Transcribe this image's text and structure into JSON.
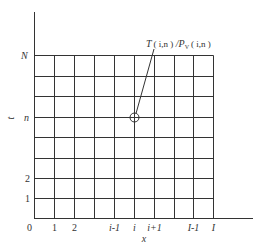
{
  "diagram": {
    "type": "finite-difference-grid",
    "annotation": {
      "T": "T",
      "args1": "( i,n )",
      "sep": " /",
      "P": "P",
      "sub": "V",
      "args2": "( i,n )"
    },
    "axes": {
      "x_label": "x",
      "t_label": "t",
      "origin": "0"
    },
    "x_ticks": [
      "1",
      "2",
      "i-1",
      "i",
      "i+1",
      "I-1",
      "I"
    ],
    "t_ticks": [
      "1",
      "2",
      "n",
      "N"
    ],
    "colors": {
      "line": "#333333",
      "background": "#ffffff"
    }
  }
}
